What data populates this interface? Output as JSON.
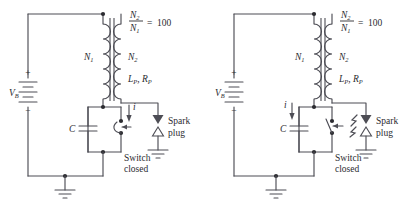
{
  "figure": {
    "background_color": "#ffffff",
    "line_color": "#4d4d55",
    "text_color": "#2b2b30"
  },
  "circuits": [
    {
      "id": "left",
      "state_caption": "Switch closed",
      "switch_state": "closed",
      "spark_plug_firing": false,
      "current_arrow": {
        "label": "i",
        "side": "right",
        "direction": "down"
      },
      "source": {
        "label": "V",
        "subscript": "B",
        "plus": "+",
        "minus": "−"
      },
      "capacitor": {
        "label": "C"
      },
      "primary_coil": {
        "label": "N",
        "subscript": "1"
      },
      "secondary_coil": {
        "label": "N",
        "subscript": "2"
      },
      "secondary_params": {
        "inductance": "L",
        "inductance_sub": "P",
        "resistance": "R",
        "resistance_sub": "P",
        "separator": ", "
      },
      "turns_ratio": {
        "numerator": "N",
        "numerator_sub": "2",
        "denominator": "N",
        "denominator_sub": "1",
        "equals": "=",
        "value": "100"
      },
      "spark_plug": {
        "line1": "Spark",
        "line2": "plug"
      }
    },
    {
      "id": "right",
      "state_caption": "Switch closed",
      "switch_state": "open",
      "spark_plug_firing": true,
      "current_arrow": {
        "label": "i",
        "side": "left",
        "direction": "down"
      },
      "source": {
        "label": "V",
        "subscript": "B",
        "plus": "+",
        "minus": "−"
      },
      "capacitor": {
        "label": "C"
      },
      "primary_coil": {
        "label": "N",
        "subscript": "1"
      },
      "secondary_coil": {
        "label": "N",
        "subscript": "2"
      },
      "secondary_params": {
        "inductance": "L",
        "inductance_sub": "P",
        "resistance": "R",
        "resistance_sub": "P",
        "separator": ", "
      },
      "turns_ratio": {
        "numerator": "N",
        "numerator_sub": "2",
        "denominator": "N",
        "denominator_sub": "1",
        "equals": "=",
        "value": "100"
      },
      "spark_plug": {
        "line1": "Spark",
        "line2": "plug"
      }
    }
  ]
}
